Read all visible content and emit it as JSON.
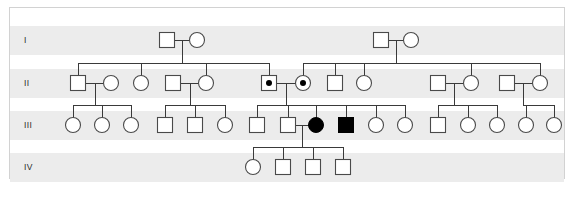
{
  "figure": {
    "type": "pedigree-chart",
    "title": "",
    "caption": "",
    "background_color": "#ffffff",
    "band_color": "#ececec",
    "border_color": "#d2d2d2",
    "line_color": "#3a3a3a",
    "symbol_fill_unaffected": "#ffffff",
    "symbol_fill_affected": "#000000",
    "symbol_stroke": "#4a4a4a"
  },
  "generations": [
    {
      "label": "I",
      "band_y": 18,
      "band_h": 29,
      "row_y": 32,
      "count": 4
    },
    {
      "label": "II",
      "band_y": 61,
      "band_h": 29,
      "row_y": 75,
      "count": 12
    },
    {
      "label": "III",
      "band_y": 103,
      "band_h": 29,
      "row_y": 117,
      "count": 16
    },
    {
      "label": "IV",
      "band_y": 145,
      "band_h": 29,
      "row_y": 159,
      "count": 4
    }
  ],
  "legend": {
    "square": "male",
    "circle": "female",
    "filled": "affected",
    "dotted": "carrier"
  },
  "individuals": [
    {
      "id": "I-1",
      "gen": "I",
      "sex": "male",
      "status": "unaffected",
      "x": 157,
      "y": 32
    },
    {
      "id": "I-2",
      "gen": "I",
      "sex": "female",
      "status": "unaffected",
      "x": 187,
      "y": 32
    },
    {
      "id": "I-3",
      "gen": "I",
      "sex": "male",
      "status": "unaffected",
      "x": 371,
      "y": 32
    },
    {
      "id": "I-4",
      "gen": "I",
      "sex": "female",
      "status": "unaffected",
      "x": 401,
      "y": 32
    },
    {
      "id": "II-1",
      "gen": "II",
      "sex": "male",
      "status": "unaffected",
      "x": 68,
      "y": 75
    },
    {
      "id": "II-2",
      "gen": "II",
      "sex": "female",
      "status": "unaffected",
      "x": 101,
      "y": 75
    },
    {
      "id": "II-3",
      "gen": "II",
      "sex": "female",
      "status": "unaffected",
      "x": 131,
      "y": 75
    },
    {
      "id": "II-4",
      "gen": "II",
      "sex": "male",
      "status": "unaffected",
      "x": 163,
      "y": 75
    },
    {
      "id": "II-5",
      "gen": "II",
      "sex": "female",
      "status": "unaffected",
      "x": 196,
      "y": 75
    },
    {
      "id": "II-6",
      "gen": "II",
      "sex": "male",
      "status": "carrier",
      "x": 259,
      "y": 75
    },
    {
      "id": "II-7",
      "gen": "II",
      "sex": "female",
      "status": "carrier",
      "x": 293,
      "y": 75
    },
    {
      "id": "II-8",
      "gen": "II",
      "sex": "male",
      "status": "unaffected",
      "x": 325,
      "y": 75
    },
    {
      "id": "II-9",
      "gen": "II",
      "sex": "female",
      "status": "unaffected",
      "x": 354,
      "y": 75
    },
    {
      "id": "II-10",
      "gen": "II",
      "sex": "male",
      "status": "unaffected",
      "x": 428,
      "y": 75
    },
    {
      "id": "II-11",
      "gen": "II",
      "sex": "female",
      "status": "unaffected",
      "x": 461,
      "y": 75
    },
    {
      "id": "II-12",
      "gen": "II",
      "sex": "male",
      "status": "unaffected",
      "x": 497,
      "y": 75
    },
    {
      "id": "II-13",
      "gen": "II",
      "sex": "female",
      "status": "unaffected",
      "x": 530,
      "y": 75
    },
    {
      "id": "III-1",
      "gen": "III",
      "sex": "female",
      "status": "unaffected",
      "x": 63,
      "y": 117
    },
    {
      "id": "III-2",
      "gen": "III",
      "sex": "female",
      "status": "unaffected",
      "x": 92,
      "y": 117
    },
    {
      "id": "III-3",
      "gen": "III",
      "sex": "female",
      "status": "unaffected",
      "x": 121,
      "y": 117
    },
    {
      "id": "III-4",
      "gen": "III",
      "sex": "male",
      "status": "unaffected",
      "x": 155,
      "y": 117
    },
    {
      "id": "III-5",
      "gen": "III",
      "sex": "male",
      "status": "unaffected",
      "x": 185,
      "y": 117
    },
    {
      "id": "III-6",
      "gen": "III",
      "sex": "female",
      "status": "unaffected",
      "x": 215,
      "y": 117
    },
    {
      "id": "III-7",
      "gen": "III",
      "sex": "male",
      "status": "unaffected",
      "x": 247,
      "y": 117
    },
    {
      "id": "III-8",
      "gen": "III",
      "sex": "male",
      "status": "unaffected",
      "x": 278,
      "y": 117
    },
    {
      "id": "III-9",
      "gen": "III",
      "sex": "female",
      "status": "affected",
      "x": 306,
      "y": 117
    },
    {
      "id": "III-10",
      "gen": "III",
      "sex": "male",
      "status": "affected",
      "x": 336,
      "y": 117
    },
    {
      "id": "III-11",
      "gen": "III",
      "sex": "female",
      "status": "unaffected",
      "x": 366,
      "y": 117
    },
    {
      "id": "III-12",
      "gen": "III",
      "sex": "female",
      "status": "unaffected",
      "x": 395,
      "y": 117
    },
    {
      "id": "III-13",
      "gen": "III",
      "sex": "male",
      "status": "unaffected",
      "x": 428,
      "y": 117
    },
    {
      "id": "III-14",
      "gen": "III",
      "sex": "female",
      "status": "unaffected",
      "x": 458,
      "y": 117
    },
    {
      "id": "III-15",
      "gen": "III",
      "sex": "female",
      "status": "unaffected",
      "x": 487,
      "y": 117
    },
    {
      "id": "III-16",
      "gen": "III",
      "sex": "female",
      "status": "unaffected",
      "x": 516,
      "y": 117
    },
    {
      "id": "III-17",
      "gen": "III",
      "sex": "female",
      "status": "unaffected",
      "x": 544,
      "y": 117
    },
    {
      "id": "IV-1",
      "gen": "IV",
      "sex": "female",
      "status": "unaffected",
      "x": 243,
      "y": 159
    },
    {
      "id": "IV-2",
      "gen": "IV",
      "sex": "male",
      "status": "unaffected",
      "x": 273,
      "y": 159
    },
    {
      "id": "IV-3",
      "gen": "IV",
      "sex": "male",
      "status": "unaffected",
      "x": 303,
      "y": 159
    },
    {
      "id": "IV-4",
      "gen": "IV",
      "sex": "male",
      "status": "unaffected",
      "x": 333,
      "y": 159
    }
  ],
  "matings": [
    {
      "id": "M1",
      "partners": [
        "I-1",
        "I-2"
      ],
      "mid_x": 172,
      "y": 32
    },
    {
      "id": "M2",
      "partners": [
        "I-3",
        "I-4"
      ],
      "mid_x": 386,
      "y": 32
    },
    {
      "id": "M3",
      "partners": [
        "II-1",
        "II-2"
      ],
      "mid_x": 85,
      "y": 75
    },
    {
      "id": "M4",
      "partners": [
        "II-4",
        "II-5"
      ],
      "mid_x": 180,
      "y": 75
    },
    {
      "id": "M5",
      "partners": [
        "II-6",
        "II-7"
      ],
      "mid_x": 276,
      "y": 75
    },
    {
      "id": "M6",
      "partners": [
        "II-10",
        "II-11"
      ],
      "mid_x": 444,
      "y": 75
    },
    {
      "id": "M7",
      "partners": [
        "II-12",
        "II-13"
      ],
      "mid_x": 513,
      "y": 75
    },
    {
      "id": "M8",
      "partners": [
        "III-8",
        "III-9"
      ],
      "mid_x": 292,
      "y": 117
    }
  ],
  "sibships": [
    {
      "parents": "M1",
      "drop_x": 172,
      "children": [
        "II-1",
        "II-3",
        "II-5",
        "II-6"
      ]
    },
    {
      "parents": "M2",
      "drop_x": 386,
      "children": [
        "II-7",
        "II-8",
        "II-9",
        "II-11",
        "II-13"
      ]
    },
    {
      "parents": "M3",
      "drop_x": 85,
      "children": [
        "III-1",
        "III-2",
        "III-3"
      ]
    },
    {
      "parents": "M4",
      "drop_x": 180,
      "children": [
        "III-4",
        "III-5",
        "III-6"
      ]
    },
    {
      "parents": "M5",
      "drop_x": 276,
      "children": [
        "III-7",
        "III-8",
        "III-9",
        "III-10",
        "III-11",
        "III-12"
      ]
    },
    {
      "parents": "M6",
      "drop_x": 444,
      "children": [
        "III-13",
        "III-14",
        "III-15"
      ]
    },
    {
      "parents": "M7",
      "drop_x": 513,
      "children": [
        "III-16",
        "III-17"
      ]
    },
    {
      "parents": "M8",
      "drop_x": 292,
      "children": [
        "IV-1",
        "IV-2",
        "IV-3",
        "IV-4"
      ]
    }
  ]
}
